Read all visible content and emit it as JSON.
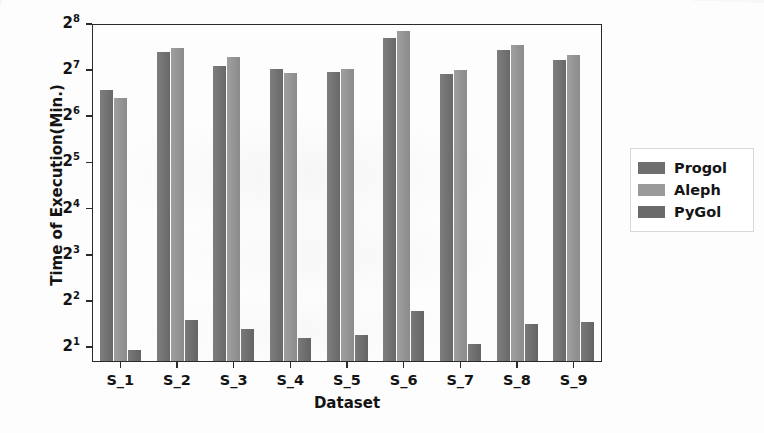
{
  "chart_data": {
    "type": "bar",
    "title": "",
    "xlabel": "Dataset",
    "ylabel": "Time of Execution(Min.)",
    "categories": [
      "S_1",
      "S_2",
      "S_3",
      "S_4",
      "S_5",
      "S_6",
      "S_7",
      "S_8",
      "S_9"
    ],
    "yscale": "log2",
    "ytick_labels": [
      "2^8",
      "2^7",
      "2^6",
      "2^5",
      "2^4",
      "2^3",
      "2^2",
      "2^1"
    ],
    "ytick_bases": [
      2,
      2,
      2,
      2,
      2,
      2,
      2,
      2
    ],
    "ytick_exponents": [
      8,
      7,
      6,
      5,
      4,
      3,
      2,
      1
    ],
    "ytick_values": [
      256,
      128,
      64,
      32,
      16,
      8,
      4,
      2
    ],
    "ylim": [
      2,
      256
    ],
    "grid": false,
    "legend_position": "right outside",
    "series": [
      {
        "name": "Progol",
        "color": "#6f6f6f",
        "values": [
          96,
          168,
          136,
          130,
          124,
          208,
          120,
          172,
          150
        ],
        "log2_values": [
          6.58,
          7.39,
          7.09,
          7.02,
          6.95,
          7.7,
          6.91,
          7.43,
          7.23
        ]
      },
      {
        "name": "Aleph",
        "color": "#949494",
        "values": [
          84,
          180,
          155,
          122,
          131,
          230,
          129,
          186,
          160
        ],
        "log2_values": [
          6.39,
          7.49,
          7.28,
          6.93,
          7.03,
          7.85,
          7.01,
          7.54,
          7.32
        ]
      },
      {
        "name": "PyGol",
        "color": "#6a6a6a",
        "values": [
          1.9,
          3.0,
          2.6,
          2.3,
          2.4,
          3.4,
          2.1,
          2.8,
          2.9
        ],
        "log2_values": [
          0.93,
          1.58,
          1.38,
          1.2,
          1.26,
          1.77,
          1.07,
          1.49,
          1.54
        ]
      }
    ]
  },
  "legend": {
    "items": [
      {
        "label": "Progol",
        "swatch_class": "progol"
      },
      {
        "label": "Aleph",
        "swatch_class": "aleph"
      },
      {
        "label": "PyGol",
        "swatch_class": "pygol"
      }
    ]
  }
}
